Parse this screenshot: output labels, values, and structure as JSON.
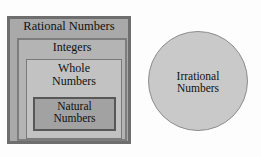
{
  "diagram": {
    "background_color": "#fdfdfd",
    "sets": {
      "rational": {
        "label": "Rational Numbers",
        "fill": "#a9a9a9",
        "border": "#6e6e6e",
        "shape": "rectangle"
      },
      "integers": {
        "label": "Integers",
        "fill": "#b4b4b4",
        "border": "#7d7d7d",
        "shape": "rectangle"
      },
      "whole": {
        "label": "Whole\nNumbers",
        "fill": "#c2c2c2",
        "border": "#7a7a7a",
        "shape": "rectangle"
      },
      "natural": {
        "label": "Natural\nNumbers",
        "fill": "#a2a2a2",
        "border": "#575757",
        "shape": "rectangle"
      },
      "irrational": {
        "label": "Irrational\nNumbers",
        "fill": "#c9c9c9",
        "border": "#8d8d8d",
        "shape": "circle"
      }
    }
  }
}
